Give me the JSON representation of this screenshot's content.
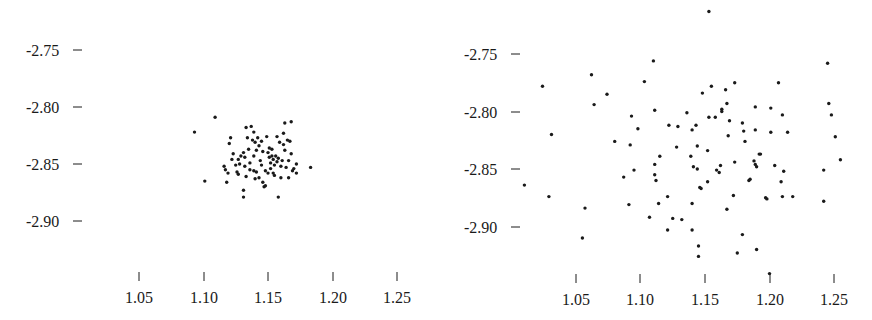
{
  "chart_data": [
    {
      "type": "scatter",
      "title": "",
      "xlabel": "",
      "ylabel": "",
      "grid": false,
      "legend": null,
      "xlim": [
        1.05,
        1.25
      ],
      "ylim": [
        -2.9,
        -2.75
      ],
      "x_ticks": [
        "1.05",
        "1.10",
        "1.15",
        "1.20",
        "1.25"
      ],
      "y_ticks": [
        "-2.75",
        "-2.80",
        "-2.85",
        "-2.90"
      ],
      "marker_color": "#1a1a1a",
      "points": [
        [
          1.093,
          -2.822
        ],
        [
          1.109,
          -2.809
        ],
        [
          1.101,
          -2.865
        ],
        [
          1.118,
          -2.866
        ],
        [
          1.117,
          -2.855
        ],
        [
          1.12,
          -2.832
        ],
        [
          1.121,
          -2.827
        ],
        [
          1.123,
          -2.841
        ],
        [
          1.122,
          -2.846
        ],
        [
          1.116,
          -2.852
        ],
        [
          1.119,
          -2.858
        ],
        [
          1.126,
          -2.857
        ],
        [
          1.127,
          -2.846
        ],
        [
          1.128,
          -2.85
        ],
        [
          1.129,
          -2.843
        ],
        [
          1.131,
          -2.84
        ],
        [
          1.132,
          -2.852
        ],
        [
          1.133,
          -2.818
        ],
        [
          1.134,
          -2.827
        ],
        [
          1.135,
          -2.837
        ],
        [
          1.132,
          -2.844
        ],
        [
          1.136,
          -2.855
        ],
        [
          1.133,
          -2.861
        ],
        [
          1.131,
          -2.873
        ],
        [
          1.131,
          -2.879
        ],
        [
          1.137,
          -2.817
        ],
        [
          1.139,
          -2.822
        ],
        [
          1.138,
          -2.829
        ],
        [
          1.14,
          -2.831
        ],
        [
          1.139,
          -2.843
        ],
        [
          1.139,
          -2.856
        ],
        [
          1.141,
          -2.857
        ],
        [
          1.14,
          -2.863
        ],
        [
          1.142,
          -2.827
        ],
        [
          1.143,
          -2.834
        ],
        [
          1.144,
          -2.847
        ],
        [
          1.145,
          -2.851
        ],
        [
          1.146,
          -2.839
        ],
        [
          1.146,
          -2.866
        ],
        [
          1.147,
          -2.87
        ],
        [
          1.148,
          -2.856
        ],
        [
          1.148,
          -2.869
        ],
        [
          1.149,
          -2.826
        ],
        [
          1.15,
          -2.84
        ],
        [
          1.151,
          -2.836
        ],
        [
          1.151,
          -2.844
        ],
        [
          1.152,
          -2.849
        ],
        [
          1.152,
          -2.854
        ],
        [
          1.153,
          -2.843
        ],
        [
          1.154,
          -2.846
        ],
        [
          1.154,
          -2.858
        ],
        [
          1.155,
          -2.851
        ],
        [
          1.155,
          -2.86
        ],
        [
          1.156,
          -2.843
        ],
        [
          1.157,
          -2.848
        ],
        [
          1.157,
          -2.826
        ],
        [
          1.158,
          -2.879
        ],
        [
          1.159,
          -2.831
        ],
        [
          1.16,
          -2.852
        ],
        [
          1.16,
          -2.862
        ],
        [
          1.161,
          -2.847
        ],
        [
          1.162,
          -2.823
        ],
        [
          1.162,
          -2.833
        ],
        [
          1.163,
          -2.838
        ],
        [
          1.163,
          -2.814
        ],
        [
          1.164,
          -2.853
        ],
        [
          1.165,
          -2.829
        ],
        [
          1.166,
          -2.847
        ],
        [
          1.167,
          -2.83
        ],
        [
          1.168,
          -2.813
        ],
        [
          1.168,
          -2.841
        ],
        [
          1.169,
          -2.856
        ],
        [
          1.166,
          -2.862
        ],
        [
          1.17,
          -2.854
        ],
        [
          1.172,
          -2.858
        ],
        [
          1.172,
          -2.85
        ],
        [
          1.183,
          -2.853
        ],
        [
          1.125,
          -2.851
        ],
        [
          1.127,
          -2.859
        ],
        [
          1.143,
          -2.862
        ],
        [
          1.136,
          -2.849
        ],
        [
          1.15,
          -2.858
        ],
        [
          1.158,
          -2.845
        ],
        [
          1.145,
          -2.83
        ],
        [
          1.141,
          -2.838
        ],
        [
          1.153,
          -2.837
        ]
      ]
    },
    {
      "type": "scatter",
      "title": "",
      "xlabel": "",
      "ylabel": "",
      "grid": false,
      "legend": null,
      "xlim": [
        1.05,
        1.25
      ],
      "ylim": [
        -2.9,
        -2.75
      ],
      "x_ticks": [
        "1.05",
        "1.10",
        "1.15",
        "1.20",
        "1.25"
      ],
      "y_ticks": [
        "-2.75",
        "-2.80",
        "-2.85",
        "-2.90"
      ],
      "marker_color": "#1a1a1a",
      "points": [
        [
          1.153,
          -2.713
        ],
        [
          1.024,
          -2.778
        ],
        [
          1.031,
          -2.82
        ],
        [
          1.01,
          -2.864
        ],
        [
          1.029,
          -2.874
        ],
        [
          1.062,
          -2.768
        ],
        [
          1.064,
          -2.794
        ],
        [
          1.074,
          -2.785
        ],
        [
          1.057,
          -2.884
        ],
        [
          1.055,
          -2.91
        ],
        [
          1.11,
          -2.756
        ],
        [
          1.103,
          -2.774
        ],
        [
          1.111,
          -2.799
        ],
        [
          1.093,
          -2.804
        ],
        [
          1.098,
          -2.815
        ],
        [
          1.08,
          -2.826
        ],
        [
          1.092,
          -2.829
        ],
        [
          1.087,
          -2.857
        ],
        [
          1.095,
          -2.851
        ],
        [
          1.091,
          -2.881
        ],
        [
          1.111,
          -2.846
        ],
        [
          1.111,
          -2.855
        ],
        [
          1.112,
          -2.86
        ],
        [
          1.115,
          -2.839
        ],
        [
          1.114,
          -2.88
        ],
        [
          1.107,
          -2.892
        ],
        [
          1.121,
          -2.874
        ],
        [
          1.121,
          -2.903
        ],
        [
          1.125,
          -2.893
        ],
        [
          1.132,
          -2.894
        ],
        [
          1.122,
          -2.812
        ],
        [
          1.129,
          -2.813
        ],
        [
          1.136,
          -2.801
        ],
        [
          1.128,
          -2.831
        ],
        [
          1.14,
          -2.816
        ],
        [
          1.143,
          -2.812
        ],
        [
          1.144,
          -2.83
        ],
        [
          1.139,
          -2.839
        ],
        [
          1.141,
          -2.848
        ],
        [
          1.144,
          -2.85
        ],
        [
          1.14,
          -2.88
        ],
        [
          1.14,
          -2.903
        ],
        [
          1.145,
          -2.917
        ],
        [
          1.145,
          -2.926
        ],
        [
          1.146,
          -2.866
        ],
        [
          1.147,
          -2.867
        ],
        [
          1.152,
          -2.834
        ],
        [
          1.152,
          -2.861
        ],
        [
          1.148,
          -2.784
        ],
        [
          1.155,
          -2.778
        ],
        [
          1.153,
          -2.805
        ],
        [
          1.158,
          -2.805
        ],
        [
          1.159,
          -2.851
        ],
        [
          1.161,
          -2.853
        ],
        [
          1.162,
          -2.847
        ],
        [
          1.163,
          -2.8
        ],
        [
          1.163,
          -2.798
        ],
        [
          1.166,
          -2.781
        ],
        [
          1.167,
          -2.793
        ],
        [
          1.169,
          -2.808
        ],
        [
          1.168,
          -2.821
        ],
        [
          1.173,
          -2.775
        ],
        [
          1.173,
          -2.844
        ],
        [
          1.172,
          -2.873
        ],
        [
          1.167,
          -2.885
        ],
        [
          1.175,
          -2.923
        ],
        [
          1.179,
          -2.907
        ],
        [
          1.179,
          -2.81
        ],
        [
          1.18,
          -2.817
        ],
        [
          1.181,
          -2.826
        ],
        [
          1.184,
          -2.86
        ],
        [
          1.185,
          -2.859
        ],
        [
          1.188,
          -2.843
        ],
        [
          1.189,
          -2.846
        ],
        [
          1.19,
          -2.848
        ],
        [
          1.192,
          -2.837
        ],
        [
          1.193,
          -2.837
        ],
        [
          1.189,
          -2.796
        ],
        [
          1.189,
          -2.816
        ],
        [
          1.19,
          -2.92
        ],
        [
          1.197,
          -2.875
        ],
        [
          1.198,
          -2.876
        ],
        [
          1.201,
          -2.797
        ],
        [
          1.201,
          -2.818
        ],
        [
          1.207,
          -2.775
        ],
        [
          1.204,
          -2.847
        ],
        [
          1.209,
          -2.861
        ],
        [
          1.21,
          -2.803
        ],
        [
          1.211,
          -2.852
        ],
        [
          1.21,
          -2.874
        ],
        [
          1.214,
          -2.818
        ],
        [
          1.218,
          -2.874
        ],
        [
          1.2,
          -2.941
        ],
        [
          1.245,
          -2.758
        ],
        [
          1.246,
          -2.793
        ],
        [
          1.248,
          -2.803
        ],
        [
          1.251,
          -2.822
        ],
        [
          1.255,
          -2.842
        ],
        [
          1.242,
          -2.851
        ],
        [
          1.242,
          -2.878
        ]
      ]
    }
  ],
  "panels": [
    {
      "y_tick_labels": [
        "-2.75",
        "-2.80",
        "-2.85",
        "-2.90"
      ],
      "x_tick_labels": [
        "1.05",
        "1.10",
        "1.15",
        "1.20",
        "1.25"
      ]
    },
    {
      "y_tick_labels": [
        "-2.75",
        "-2.80",
        "-2.85",
        "-2.90"
      ],
      "x_tick_labels": [
        "1.05",
        "1.10",
        "1.15",
        "1.20",
        "1.25"
      ]
    }
  ]
}
